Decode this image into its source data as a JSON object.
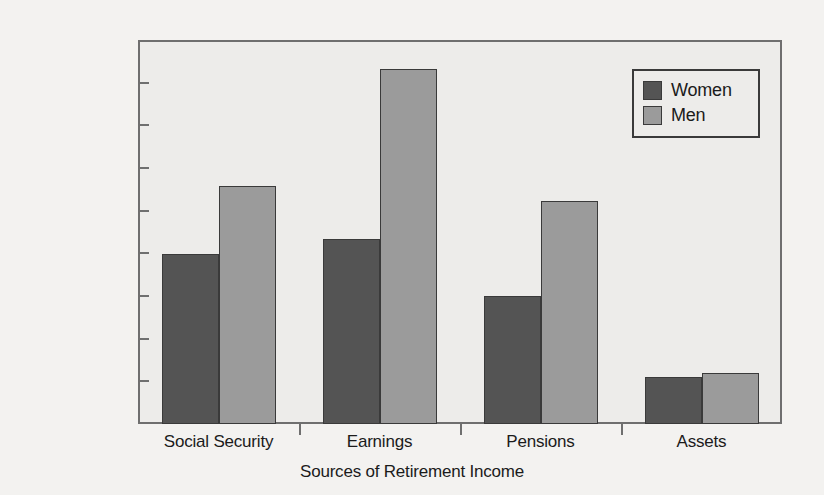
{
  "chart_data": {
    "type": "bar",
    "title": "",
    "xlabel": "Sources of Retirement Income",
    "ylabel": "",
    "categories": [
      "Social Security",
      "Earnings",
      "Pensions",
      "Assets"
    ],
    "series": [
      {
        "name": "Women",
        "color": "#545454",
        "values": [
          7950,
          8650,
          6000,
          2200
        ]
      },
      {
        "name": "Men",
        "color": "#9b9b9b",
        "values": [
          11150,
          16650,
          10450,
          2400
        ]
      }
    ],
    "ylim": [
      0,
      18000
    ],
    "ytick_values": [
      0,
      2000,
      4000,
      6000,
      8000,
      10000,
      12000,
      14000,
      16000,
      18000
    ],
    "ytick_labels": [
      "$0",
      "$2,000",
      "$4,000",
      "$6,000",
      "$8,000",
      "$10,000",
      "$12,000",
      "$14,000",
      "$16,000",
      "$18,000"
    ],
    "grid": false,
    "legend_position": "top-right",
    "plot_background": "#edecea",
    "frame_color": "#6f6f6f"
  },
  "legend": {
    "entries": [
      {
        "label": "Women"
      },
      {
        "label": "Men"
      }
    ]
  },
  "axes": {
    "x_title": "Sources of Retirement Income"
  }
}
